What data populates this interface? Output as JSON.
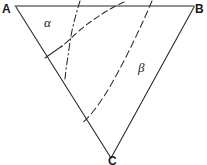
{
  "figure": {
    "type": "geometry-diagram",
    "background_color": "#ffffff",
    "line_color": "#2b2b2b",
    "top_edge_color": "#6f6f6f",
    "width": 207,
    "height": 165,
    "vertices": [
      {
        "id": "A",
        "label": "A",
        "x": 16,
        "y": 6,
        "label_x": 3,
        "label_y": 12
      },
      {
        "id": "B",
        "label": "B",
        "x": 194,
        "y": 6,
        "label_x": 196,
        "label_y": 12
      },
      {
        "id": "C",
        "label": "C",
        "x": 111,
        "y": 158,
        "label_x": 110,
        "label_y": 165
      }
    ],
    "sides": [
      {
        "name": "side-ab",
        "from": "A",
        "to": "B",
        "style": "solid",
        "path": "M 15 6 L 194 6"
      },
      {
        "name": "side-ac",
        "from": "A",
        "to": "C",
        "style": "solid",
        "path": "M 16 7 L 111 158"
      },
      {
        "name": "side-bc",
        "from": "B",
        "to": "C",
        "style": "solid",
        "path": "M 194 7 L 111 158"
      }
    ],
    "curves": [
      {
        "name": "curve-left",
        "style": "dash-dot",
        "dash_pattern": "7 3 1.5 3",
        "path": "M 80 1 C 76 14, 72 28, 70 42 C 68 56, 66 68, 65 79",
        "from_edge": "side-ab",
        "to_edge": "side-ac"
      },
      {
        "name": "curve-middle",
        "style": "dashed",
        "dash_pattern": "6 3.5",
        "path": "M 124 2 C 110 8, 92 20, 80 30 C 72 37, 66 43, 61 47",
        "from_edge": "side-ab",
        "to_edge": "interior"
      },
      {
        "name": "curve-right",
        "style": "dashed",
        "dash_pattern": "7 4",
        "path": "M 152 1 C 143 22, 128 55, 112 83 C 100 104, 89 118, 81 124",
        "from_edge": "side-ab",
        "to_edge": "side-ac"
      }
    ],
    "segments": [
      {
        "name": "angle-tick-segment",
        "style": "solid",
        "path": "M 45 58 L 62 46"
      }
    ],
    "angle_labels": [
      {
        "name": "alpha-label",
        "text": "α",
        "x": 46,
        "y": 27
      },
      {
        "name": "beta-label",
        "text": "β",
        "x": 140,
        "y": 72
      }
    ]
  }
}
